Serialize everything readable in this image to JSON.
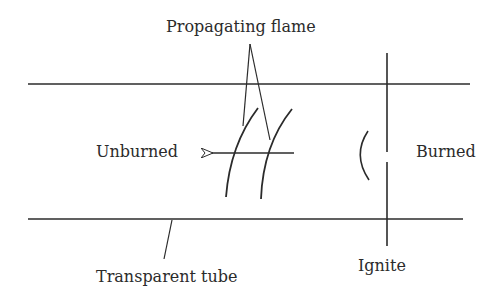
{
  "labels": {
    "propagating_flame": "Propagating flame",
    "unburned": "Unburned",
    "burned": "Burned",
    "transparent_tube": "Transparent tube",
    "ignite": "Ignite"
  },
  "colors": {
    "line": "#2b2b2b",
    "background": "#ffffff"
  }
}
